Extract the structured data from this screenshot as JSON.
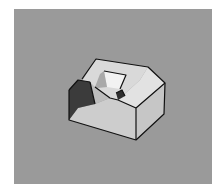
{
  "image": {
    "description": "3D rendered solid block with a chamfered right edge, a square through-hole on top, and a notched step cutout on the front-left",
    "background_color": "#9a9a9a",
    "page_color": "#ffffff"
  },
  "object": {
    "colors": {
      "top_face": "#d9d9d9",
      "right_face": "#c8c8c8",
      "chamfer_face": "#e0e0e0",
      "front_face": "#cfcfcf",
      "dark_inner_wall": "#3a3a3a",
      "step_floor": "#c2c2c2",
      "hole_inner_light": "#f0f0f0",
      "hole_inner_shade": "#a8a8a8",
      "edge": "#111111"
    }
  }
}
